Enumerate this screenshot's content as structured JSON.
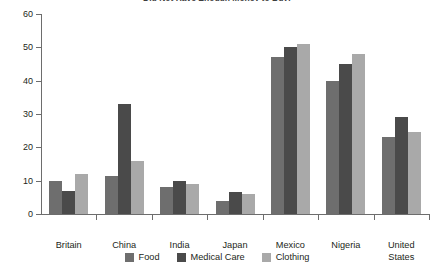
{
  "chart_data": {
    "type": "bar",
    "title": "Did Not Have Enough Money to Buy:",
    "xlabel": "",
    "ylabel": "",
    "ylim": [
      0,
      60
    ],
    "yticks": [
      0,
      10,
      20,
      30,
      40,
      50,
      60
    ],
    "grid": false,
    "legend_position": "bottom-center",
    "categories": [
      "Britain",
      "China",
      "India",
      "Japan",
      "Mexico",
      "Nigeria",
      "United\nStates"
    ],
    "series": [
      {
        "name": "Food",
        "color": "#6e6e6e",
        "values": [
          10,
          11.5,
          8,
          4,
          47,
          40,
          23
        ]
      },
      {
        "name": "Medical Care",
        "color": "#4a4a4a",
        "values": [
          7,
          33,
          10,
          6.5,
          50,
          45,
          29
        ]
      },
      {
        "name": "Clothing",
        "color": "#a9a9a9",
        "values": [
          12,
          16,
          9,
          6,
          51,
          48,
          24.5
        ]
      }
    ]
  }
}
